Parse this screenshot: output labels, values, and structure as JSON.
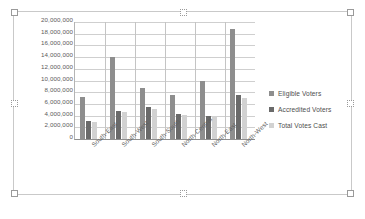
{
  "chart_data": {
    "type": "bar",
    "title": "",
    "subtitle": "",
    "xlabel": "",
    "ylabel": "",
    "categories": [
      "South-East",
      "South-West",
      "South-South",
      "North-Central",
      "North-East",
      "North-West"
    ],
    "series": [
      {
        "name": "Eligible Voters",
        "color": "#8e8e8e",
        "values": [
          7100000,
          14100000,
          8800000,
          7600000,
          10000000,
          18800000
        ]
      },
      {
        "name": "Accredited Voters",
        "color": "#6a6a6a",
        "values": [
          3000000,
          4800000,
          5400000,
          4300000,
          4000000,
          7600000
        ]
      },
      {
        "name": "Total Votes Cast",
        "color": "#d2d2d2",
        "values": [
          2900000,
          4600000,
          5200000,
          4100000,
          4000000,
          7000000
        ]
      }
    ],
    "ylim": [
      0,
      20000000
    ],
    "ytick_step": 2000000,
    "ytick_labels": [
      "20,000,000",
      "18,000,000",
      "16,000,000",
      "14,000,000",
      "12,000,000",
      "10,000,000",
      "8,000,000",
      "6,000,000",
      "4,000,000",
      "2,000,000",
      "0"
    ],
    "grid": true,
    "legend_position": "right",
    "category_separators": true
  },
  "legend": {
    "items": [
      {
        "label": "Eligible Voters"
      },
      {
        "label": "Accredited Voters"
      },
      {
        "label": "Total Votes Cast"
      }
    ]
  },
  "chart_object": {
    "selected": true,
    "handles": [
      "top-left",
      "top-center",
      "top-right",
      "middle-left",
      "middle-right",
      "bottom-left",
      "bottom-center",
      "bottom-right"
    ]
  }
}
